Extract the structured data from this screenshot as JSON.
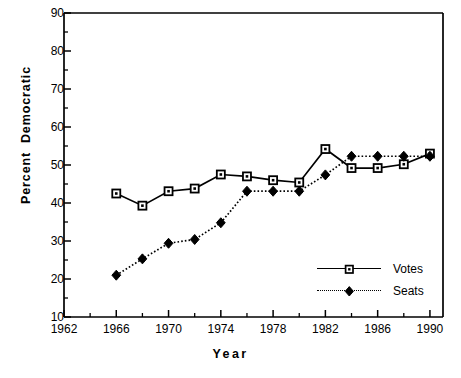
{
  "chart_data": {
    "type": "line",
    "title": "",
    "xlabel": "Year",
    "ylabel": "Percent  Democratic",
    "xlim": [
      1962,
      1991
    ],
    "ylim": [
      10,
      90
    ],
    "grid": false,
    "legend_position": "inside-bottom-right",
    "x_major_ticks": [
      1962,
      1966,
      1970,
      1974,
      1978,
      1982,
      1986,
      1990
    ],
    "x_minor_ticks": [
      1964,
      1968,
      1972,
      1976,
      1980,
      1984,
      1988
    ],
    "y_major_ticks": [
      10,
      20,
      30,
      40,
      50,
      60,
      70,
      80,
      90
    ],
    "y_minor_ticks": [
      15,
      25,
      35,
      45,
      55,
      65,
      75,
      85
    ],
    "x": [
      1966,
      1968,
      1970,
      1972,
      1974,
      1976,
      1978,
      1980,
      1982,
      1984,
      1986,
      1988,
      1990
    ],
    "series": [
      {
        "name": "Votes",
        "marker": "open-square",
        "linestyle": "solid",
        "color": "#000000",
        "values": [
          42.5,
          39.3,
          43.1,
          43.8,
          47.5,
          47.0,
          46.0,
          45.4,
          54.2,
          49.2,
          49.2,
          50.2,
          53.0
        ]
      },
      {
        "name": "Seats",
        "marker": "filled-diamond",
        "linestyle": "dotted",
        "color": "#000000",
        "values": [
          21.0,
          25.3,
          29.4,
          30.4,
          34.8,
          43.1,
          43.1,
          43.1,
          47.4,
          52.3,
          52.3,
          52.3,
          52.3
        ]
      }
    ]
  },
  "axis": {
    "y_tick_labels": [
      "90",
      "80",
      "70",
      "60",
      "50",
      "40",
      "30",
      "20",
      "10"
    ],
    "x_tick_labels": [
      "1962",
      "1966",
      "1970",
      "1974",
      "1978",
      "1982",
      "1986",
      "1990"
    ],
    "y_title": "Percent  Democratic",
    "x_title": "Year"
  },
  "legend": {
    "entries": [
      {
        "label": "Votes"
      },
      {
        "label": "Seats"
      }
    ]
  },
  "colors": {
    "axis": "#000000",
    "series_votes": "#000000",
    "series_seats": "#000000",
    "background": "#ffffff"
  }
}
